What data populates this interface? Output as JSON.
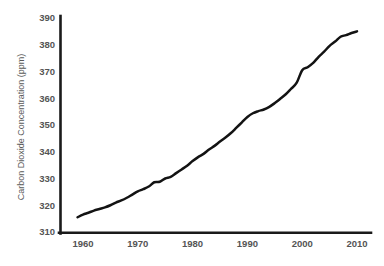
{
  "chart_data": {
    "type": "line",
    "title": "",
    "subtitle": "",
    "xlabel": "",
    "ylabel": "Carbon Dioxide Concentration (ppm)",
    "xlim": [
      1955,
      2012.5
    ],
    "ylim": [
      310,
      390
    ],
    "xticks": [
      1960,
      1970,
      1980,
      1990,
      2000,
      2010
    ],
    "xtick_labels": [
      "1960",
      "1970",
      "1980",
      "1990",
      "2000",
      "2010"
    ],
    "yticks": [
      310,
      320,
      330,
      340,
      350,
      360,
      370,
      380,
      390
    ],
    "ytick_labels": [
      "310",
      "320",
      "330",
      "340",
      "350",
      "360",
      "370",
      "380",
      "390"
    ],
    "grid": false,
    "legend": false,
    "legend_position": "none",
    "line_color": "#131313",
    "axis_color": "#1a1a1a",
    "tick_label_color": "#545454",
    "background_color": "#ffffff",
    "series": [
      {
        "name": "Atmospheric CO2 concentration",
        "x": [
          1959,
          1960,
          1961,
          1962,
          1963,
          1964,
          1965,
          1966,
          1967,
          1968,
          1969,
          1970,
          1971,
          1972,
          1973,
          1974,
          1975,
          1976,
          1977,
          1978,
          1979,
          1980,
          1981,
          1982,
          1983,
          1984,
          1985,
          1986,
          1987,
          1988,
          1989,
          1990,
          1991,
          1992,
          1993,
          1994,
          1995,
          1996,
          1997,
          1998,
          1999,
          2000,
          2001,
          2002,
          2003,
          2004,
          2005,
          2006,
          2007,
          2008,
          2009,
          2010
        ],
        "values": [
          315.5,
          316.5,
          317.2,
          318.0,
          318.6,
          319.2,
          320.0,
          321.0,
          321.8,
          322.8,
          324.0,
          325.2,
          326.0,
          327.0,
          328.6,
          328.8,
          330.0,
          330.6,
          332.0,
          333.4,
          334.8,
          336.5,
          338.0,
          339.2,
          340.8,
          342.2,
          343.8,
          345.3,
          347.0,
          349.0,
          351.0,
          353.0,
          354.4,
          355.2,
          355.8,
          356.8,
          358.2,
          359.8,
          361.5,
          363.6,
          365.8,
          370.5,
          371.6,
          373.2,
          375.5,
          377.4,
          379.6,
          381.2,
          383.0,
          383.6,
          384.4,
          385.0
        ]
      }
    ]
  },
  "axis": {
    "ylabel": "Carbon Dioxide Concentration (ppm)"
  }
}
